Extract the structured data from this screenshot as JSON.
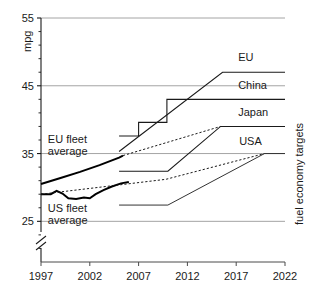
{
  "chart_data": {
    "type": "line",
    "title": "",
    "xlabel": "",
    "ylabel": "mpg",
    "right_axis_label": "fuel economy targets",
    "xlim": [
      1997,
      2022
    ],
    "ylim": [
      19,
      55
    ],
    "y_axis_break": true,
    "grid": true,
    "grid_lines_y": [
      55,
      45,
      35,
      25
    ],
    "xticks": [
      1997,
      2002,
      2007,
      2012,
      2017,
      2022
    ],
    "xtick_labels": [
      "1997",
      "2002",
      "2007",
      "2012",
      "2017",
      "2022"
    ],
    "yticks": [
      25,
      35,
      45,
      55
    ],
    "ytick_labels": [
      "25",
      "35",
      "45",
      "55"
    ],
    "yticks_minor": [
      21,
      23,
      27,
      29,
      31,
      33,
      37,
      39,
      41,
      43,
      47,
      49,
      51,
      53
    ],
    "legend_position": "inline-right-of-series",
    "series": [
      {
        "name": "EU",
        "label": "EU",
        "style": "solid",
        "width": 1.1,
        "color": "#1a1a1a",
        "label_x": 2017.2,
        "label_y": 48.6,
        "points": [
          [
            2005.0,
            35.3
          ],
          [
            2015.6,
            47.0
          ],
          [
            2022.0,
            47.0
          ]
        ]
      },
      {
        "name": "China",
        "label": "China",
        "style": "solid-step",
        "width": 1.1,
        "color": "#1a1a1a",
        "label_x": 2017.2,
        "label_y": 44.5,
        "points": [
          [
            2005.0,
            37.6
          ],
          [
            2007.0,
            37.6
          ],
          [
            2007.0,
            39.6
          ],
          [
            2009.9,
            39.6
          ],
          [
            2009.9,
            43.0
          ],
          [
            2022.0,
            43.0
          ]
        ]
      },
      {
        "name": "Japan",
        "label": "Japan",
        "style": "solid",
        "width": 1.1,
        "color": "#1a1a1a",
        "label_x": 2017.2,
        "label_y": 40.6,
        "points": [
          [
            2005.0,
            32.4
          ],
          [
            2010.0,
            32.4
          ],
          [
            2015.4,
            39.0
          ],
          [
            2022.0,
            39.0
          ]
        ]
      },
      {
        "name": "USA",
        "label": "USA",
        "style": "solid",
        "width": 1.0,
        "color": "#333333",
        "label_x": 2017.3,
        "label_y": 36.3,
        "points": [
          [
            2005.0,
            27.4
          ],
          [
            2010.0,
            27.4
          ],
          [
            2019.9,
            35.0
          ],
          [
            2022.0,
            35.0
          ]
        ]
      },
      {
        "name": "EU fleet average",
        "label": "EU fleet average",
        "style": "thick-solid",
        "width": 2.0,
        "color": "#000000",
        "points": [
          [
            1997.0,
            30.5
          ],
          [
            1999.0,
            31.4
          ],
          [
            2001.0,
            32.3
          ],
          [
            2003.0,
            33.3
          ],
          [
            2005.0,
            34.4
          ],
          [
            2005.4,
            34.7
          ]
        ]
      },
      {
        "name": "EU fleet average projection",
        "label": "",
        "style": "dashed",
        "width": 1.0,
        "color": "#1a1a1a",
        "points": [
          [
            2005.4,
            34.7
          ],
          [
            2015.4,
            39.0
          ]
        ]
      },
      {
        "name": "US fleet average",
        "label": "US fleet average",
        "style": "thick-solid",
        "width": 2.0,
        "color": "#000000",
        "points": [
          [
            1997.0,
            29.0
          ],
          [
            1998.0,
            29.0
          ],
          [
            1998.6,
            29.5
          ],
          [
            1999.2,
            29.1
          ],
          [
            1999.8,
            28.4
          ],
          [
            2000.6,
            28.3
          ],
          [
            2001.4,
            28.5
          ],
          [
            2002.0,
            28.4
          ],
          [
            2002.6,
            29.0
          ],
          [
            2003.4,
            29.6
          ],
          [
            2004.2,
            30.1
          ],
          [
            2005.2,
            30.6
          ],
          [
            2006.0,
            30.8
          ]
        ]
      },
      {
        "name": "US fleet average projection",
        "label": "",
        "style": "dashed",
        "width": 1.0,
        "color": "#1a1a1a",
        "points": [
          [
            1997.0,
            29.0
          ],
          [
            2004.0,
            30.2
          ],
          [
            2009.8,
            31.2
          ],
          [
            2019.9,
            35.0
          ]
        ]
      }
    ],
    "annotations": [
      {
        "name": "eu-fleet-average-annotation",
        "text_line1": "EU fleet",
        "text_line2": "average",
        "x": 1997.7,
        "y": 36.5
      },
      {
        "name": "us-fleet-average-annotation",
        "text_line1": "US fleet",
        "text_line2": "average",
        "x": 1997.7,
        "y": 26.4
      }
    ]
  }
}
